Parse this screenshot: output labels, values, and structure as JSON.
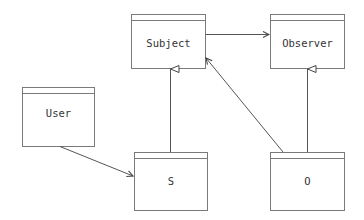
{
  "diagram": {
    "type": "uml-class-diagram",
    "colors": {
      "stroke": "#7a7a7a",
      "edge": "#555555",
      "text": "#333333",
      "background": "#ffffff"
    },
    "classes": [
      {
        "id": "subject",
        "label": "Subject"
      },
      {
        "id": "observer",
        "label": "Observer"
      },
      {
        "id": "user",
        "label": "User"
      },
      {
        "id": "s",
        "label": "S"
      },
      {
        "id": "o",
        "label": "O"
      }
    ],
    "relations": [
      {
        "from": "Subject",
        "to": "Observer",
        "kind": "association"
      },
      {
        "from": "S",
        "to": "Subject",
        "kind": "generalization"
      },
      {
        "from": "O",
        "to": "Observer",
        "kind": "generalization"
      },
      {
        "from": "User",
        "to": "S",
        "kind": "association"
      },
      {
        "from": "O",
        "to": "Subject",
        "kind": "association"
      }
    ]
  }
}
